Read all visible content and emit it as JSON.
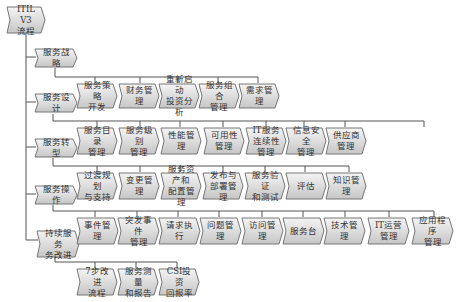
{
  "diagram": {
    "root": {
      "label": "ITIL V3\n流程"
    },
    "stages": [
      {
        "label": "服务战略",
        "children": []
      },
      {
        "label": "服务设计",
        "children": [
          "服务策略\n开发",
          "财务管理",
          "重新启动\n投资分析",
          "服务组合\n管理",
          "需求管理"
        ]
      },
      {
        "label": "服务转型",
        "children": [
          "服务目录\n管理",
          "服务级别\n管理",
          "性能管理",
          "可用性\n管理",
          "IT服务\n连续性管理",
          "信息安全\n管理",
          "供应商\n管理"
        ]
      },
      {
        "label": "服务操作",
        "children": [
          "过渡规划\n与支持",
          "变更管理",
          "服务资产和\n配置管理",
          "发布与\n部署管理",
          "服务验证\n和测试",
          "评估",
          "知识管理"
        ]
      },
      {
        "label": "持续服务\n务改进",
        "children": [
          "事件管理",
          "突发事件\n管理",
          "请求执行",
          "问题管理",
          "访问管理",
          "服务台",
          "技术管理",
          "IT运营\n管理",
          "应用程序\n管理"
        ]
      },
      {
        "label": "",
        "children": [
          "7步改进\n流程",
          "服务测量\n和报告",
          "CSI投资\n回报率"
        ]
      }
    ]
  },
  "colors": {
    "box_fill_top": "#f2f2f2",
    "box_fill_bottom": "#c8c8c8",
    "box_stroke": "#777777",
    "line": "#555555"
  }
}
